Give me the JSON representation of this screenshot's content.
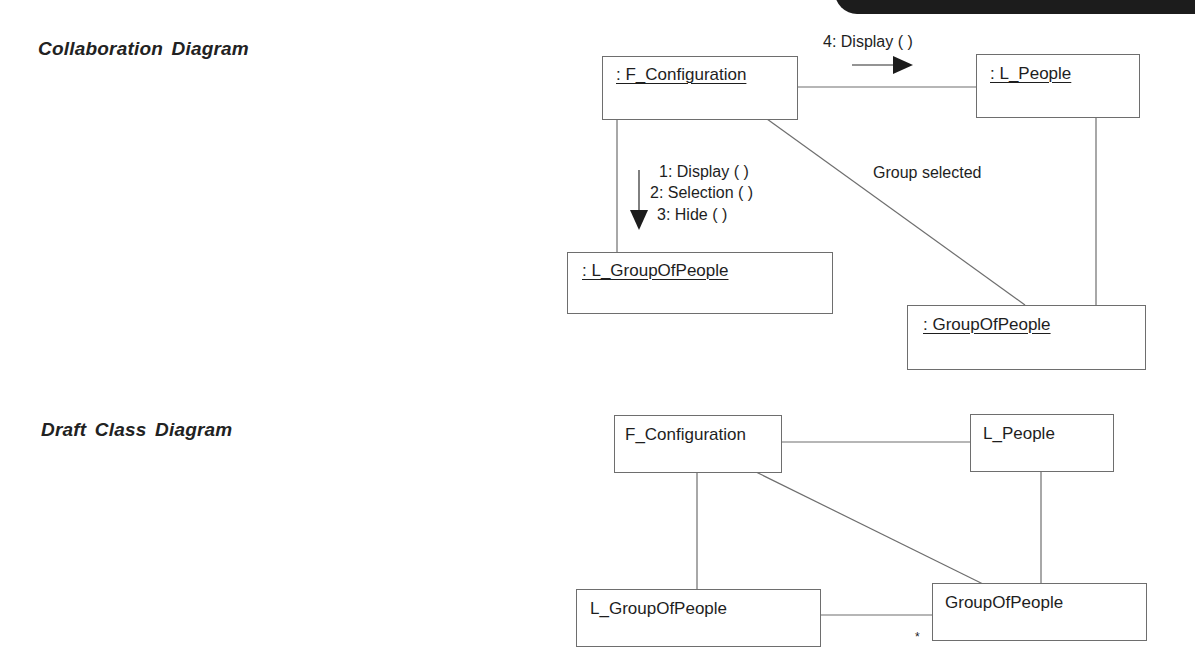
{
  "collaboration": {
    "title": "Collaboration Diagram",
    "objects": {
      "f_configuration": ": F_Configuration",
      "l_people": ": L_People",
      "l_group_of_people": ": L_GroupOfPeople",
      "group_of_people": ": GroupOfPeople"
    },
    "messages": {
      "to_l_people": "4: Display ( )",
      "to_l_group_1": "1: Display ( )",
      "to_l_group_2": "2: Selection ( )",
      "to_l_group_3": "3: Hide ( )"
    },
    "link_labels": {
      "config_to_group": "Group selected"
    }
  },
  "class_diagram": {
    "title": "Draft Class Diagram",
    "classes": {
      "f_configuration": "F_Configuration",
      "l_people": "L_People",
      "l_group_of_people": "L_GroupOfPeople",
      "group_of_people": "GroupOfPeople"
    },
    "multiplicities": {
      "group_of_people_end": "*"
    }
  },
  "colors": {
    "line": "#6e6e6e",
    "text": "#1e1e1e",
    "tab": "#1c1c1c"
  }
}
